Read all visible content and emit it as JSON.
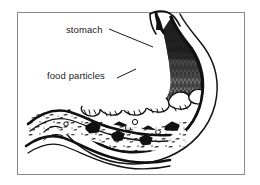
{
  "figure": {
    "type": "anatomical-line-diagram",
    "style": "black ink line drawing on white",
    "frame": {
      "border_color": "#8a8a8a",
      "background": "#ffffff"
    }
  },
  "labels": [
    {
      "id": "stomach",
      "text": "stomach",
      "leader": "line from label right edge sloping down-right to upper stomach wall"
    },
    {
      "id": "food_particles",
      "text": "food particles",
      "leader": "line from label right edge sloping up-right to stomach wall near food layer"
    }
  ],
  "parts": {
    "esophagus": "narrow notch entering at top of stomach",
    "fundus_body": "large dark hatched chamber, gray fill with vertical strokes",
    "food_layer": "band of rounded white chunks with dark outlines across lower stomach",
    "chyme": "speckled stippled fluid in lower stomach and intestine",
    "intestine": "wavy double-outlined tube extending to the left"
  },
  "colors": {
    "ink": "#111111",
    "paper": "#ffffff",
    "interior_gray": "#6f6f6f",
    "frame": "#8a8a8a",
    "text": "#1a1a1a"
  }
}
